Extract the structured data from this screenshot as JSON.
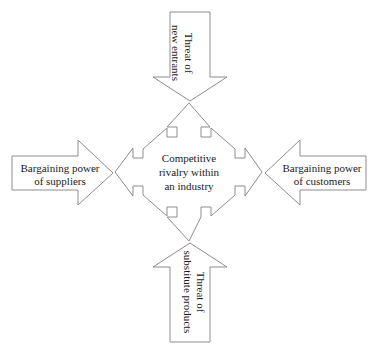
{
  "diagram": {
    "stroke_color": "#8d8d8d",
    "fill_color": "#ffffff",
    "text_color": "#1b1b1b",
    "center": {
      "name": "competitive-rivalry",
      "lines": [
        "Competitive",
        "rivalry within",
        "an industry"
      ],
      "text": "Competitive\nrivalry within\nan industry",
      "shape": "four-way-arrow"
    },
    "forces": [
      {
        "id": "new-entrants",
        "text": "Threat of\nnew entrants",
        "position": "top",
        "shape": "down-arrow",
        "orientation": "vertical",
        "points_to": "center"
      },
      {
        "id": "suppliers",
        "text": "Bargaining power\nof suppliers",
        "position": "left",
        "shape": "right-arrow",
        "orientation": "horizontal",
        "points_to": "center"
      },
      {
        "id": "customers",
        "text": "Bargaining power\nof customers",
        "position": "right",
        "shape": "left-arrow",
        "orientation": "horizontal",
        "points_to": "center"
      },
      {
        "id": "substitute-products",
        "text": "Threat of\nsubstitute products",
        "position": "bottom",
        "shape": "up-arrow",
        "orientation": "vertical",
        "points_to": "center"
      }
    ]
  }
}
